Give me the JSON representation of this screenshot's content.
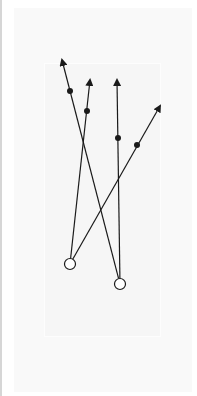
{
  "diagram": {
    "title": "",
    "type": "play-diagram",
    "colors": {
      "line": "#1a1a1a",
      "background": "#ffffff",
      "panel": "#f9f9f9"
    },
    "players": [
      {
        "id": "p1",
        "symbol": "open-circle"
      },
      {
        "id": "p2",
        "symbol": "open-circle"
      }
    ],
    "routes": [
      {
        "id": "r1",
        "from": "p1",
        "marker": "dot",
        "end": "arrow"
      },
      {
        "id": "r2",
        "from": "p1",
        "marker": "dot",
        "end": "arrow"
      },
      {
        "id": "r3",
        "from": "p2",
        "marker": "dot",
        "end": "arrow"
      },
      {
        "id": "r4",
        "from": "p2",
        "marker": "dot",
        "end": "arrow"
      }
    ]
  }
}
